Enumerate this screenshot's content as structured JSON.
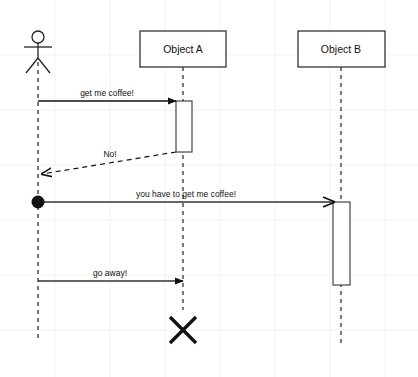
{
  "diagram": {
    "type": "uml-sequence-diagram",
    "canvas": {
      "width": 418,
      "height": 377,
      "background": "#ffffff"
    },
    "grid": {
      "visible": true,
      "spacing": 55,
      "color": "#f2f2f2"
    },
    "colors": {
      "stroke": "#222222",
      "box_fill": "#ffffff",
      "box_stroke": "#333333",
      "activation_fill": "#ffffff",
      "activation_stroke": "#444444",
      "text": "#111111",
      "grid": "#f2f2f2"
    },
    "participants": [
      {
        "id": "actor",
        "kind": "actor",
        "label": "",
        "x": 38,
        "head": {
          "cx": 38,
          "cy": 37,
          "r": 6
        },
        "body": {
          "x1": 38,
          "y1": 43,
          "x2": 38,
          "y2": 58
        },
        "arms": {
          "x1": 24,
          "y1": 47,
          "x2": 52,
          "y2": 47
        },
        "legs": {
          "left_x": 26,
          "right_x": 50,
          "y": 72
        },
        "lifeline": {
          "x": 38,
          "y_top": 62,
          "y_bottom": 340
        }
      },
      {
        "id": "objectA",
        "kind": "object",
        "label": "Object A",
        "box": {
          "x": 140,
          "y": 31,
          "width": 86,
          "height": 36
        },
        "lifeline": {
          "x": 183,
          "y_top": 67,
          "y_bottom": 310
        }
      },
      {
        "id": "objectB",
        "kind": "object",
        "label": "Object B",
        "box": {
          "x": 298,
          "y": 31,
          "width": 87,
          "height": 36
        },
        "lifeline": {
          "x": 341,
          "y_top": 67,
          "y_bottom": 345
        }
      }
    ],
    "activations": [
      {
        "id": "activation-a",
        "participant": "objectA",
        "x": 176,
        "y": 101,
        "width": 16,
        "height": 51
      },
      {
        "id": "activation-b",
        "participant": "objectB",
        "x": 333,
        "y": 202,
        "width": 17,
        "height": 83
      }
    ],
    "messages": [
      {
        "id": "msg-get-me-coffee",
        "label": "get me coffee!",
        "from": "actor",
        "to": "objectA",
        "style": "solid",
        "arrowhead": "filled",
        "start_marker": "none",
        "x1": 38,
        "y1": 101,
        "x2": 176,
        "y2": 101,
        "label_x": 107,
        "label_y": 96
      },
      {
        "id": "msg-no",
        "label": "No!",
        "from": "objectA",
        "to": "actor",
        "style": "dashed",
        "arrowhead": "open",
        "start_marker": "none",
        "x1": 176,
        "y1": 152,
        "x2": 41,
        "y2": 174,
        "label_x": 110,
        "label_y": 156
      },
      {
        "id": "msg-you-have-to-get-me-coffee",
        "label": "you have to get me coffee!",
        "from": "actor",
        "to": "objectB",
        "style": "solid",
        "arrowhead": "open",
        "start_marker": "filled-circle",
        "x1": 38,
        "y1": 202,
        "x2": 333,
        "y2": 202,
        "label_x": 186,
        "label_y": 197
      },
      {
        "id": "msg-go-away",
        "label": "go away!",
        "from": "actor",
        "to": "objectA",
        "style": "solid",
        "arrowhead": "filled",
        "start_marker": "none",
        "x1": 38,
        "y1": 281,
        "x2": 183,
        "y2": 281,
        "label_x": 110,
        "label_y": 276
      }
    ],
    "start_markers": [
      {
        "id": "found-message-ball",
        "cx": 38,
        "cy": 202,
        "r": 6,
        "fill": "#111111"
      }
    ],
    "destructions": [
      {
        "id": "destroy-objectA",
        "participant": "objectA",
        "cx": 183,
        "cy": 330,
        "size": 13
      }
    ]
  }
}
